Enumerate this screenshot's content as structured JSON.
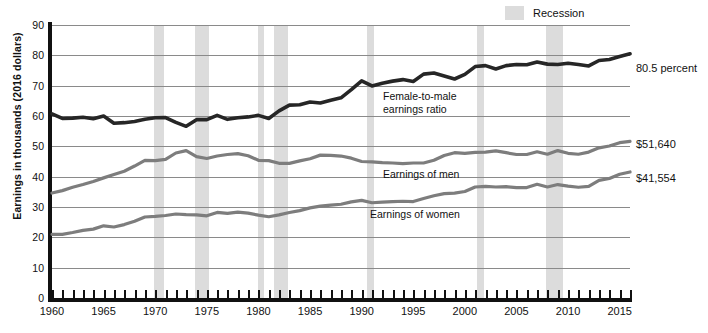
{
  "legend": {
    "position": "top-right",
    "entries": [
      {
        "label": "Recession",
        "color": "#dcdcdc",
        "type": "band"
      }
    ]
  },
  "axes": {
    "ylabel": "Earnings in thousands (2016 dollars)",
    "yticks": [
      "0",
      "10",
      "20",
      "30",
      "40",
      "50",
      "60",
      "70",
      "80",
      "90"
    ],
    "xticks": [
      "1960",
      "1965",
      "1970",
      "1975",
      "1980",
      "1985",
      "1990",
      "1995",
      "2000",
      "2005",
      "2010",
      "2015"
    ]
  },
  "annotations": [
    {
      "name": "ratio-annotation",
      "line1": "Female-to-male",
      "line2": "earnings ratio"
    },
    {
      "name": "men-annotation",
      "line1": "Earnings of men",
      "line2": ""
    },
    {
      "name": "women-annotation",
      "line1": "Earnings of women",
      "line2": ""
    }
  ],
  "end_labels": [
    {
      "name": "ratio-end-label",
      "text": "80.5 percent"
    },
    {
      "name": "men-end-label",
      "text": "$51,640"
    },
    {
      "name": "women-end-label",
      "text": "$41,554"
    }
  ],
  "chart_data": {
    "type": "line",
    "title": "",
    "subtitle": "",
    "xlabel": "",
    "ylabel": "Earnings in thousands (2016 dollars)",
    "xlim": [
      1960,
      2016
    ],
    "ylim": [
      0,
      90
    ],
    "ytick_step": 10,
    "xtick_step_minor": 1,
    "xtick_step_major": 5,
    "grid": "horizontal",
    "legend_position": "top-right",
    "x": [
      1960,
      1961,
      1962,
      1963,
      1964,
      1965,
      1966,
      1967,
      1968,
      1969,
      1970,
      1971,
      1972,
      1973,
      1974,
      1975,
      1976,
      1977,
      1978,
      1979,
      1980,
      1981,
      1982,
      1983,
      1984,
      1985,
      1986,
      1987,
      1988,
      1989,
      1990,
      1991,
      1992,
      1993,
      1994,
      1995,
      1996,
      1997,
      1998,
      1999,
      2000,
      2001,
      2002,
      2003,
      2004,
      2005,
      2006,
      2007,
      2008,
      2009,
      2010,
      2011,
      2012,
      2013,
      2014,
      2015,
      2016
    ],
    "series": [
      {
        "name": "Female-to-male earnings ratio",
        "units": "percent",
        "color": "#262626",
        "end_value": 80.5,
        "end_label": "80.5 percent",
        "values": [
          60.7,
          59.2,
          59.3,
          59.6,
          59.1,
          60.0,
          57.6,
          57.8,
          58.2,
          58.9,
          59.4,
          59.5,
          57.9,
          56.6,
          58.8,
          58.8,
          60.2,
          58.9,
          59.4,
          59.7,
          60.2,
          59.2,
          61.7,
          63.6,
          63.7,
          64.6,
          64.3,
          65.2,
          66.0,
          68.7,
          71.6,
          69.9,
          70.8,
          71.5,
          72.0,
          71.4,
          73.8,
          74.2,
          73.2,
          72.2,
          73.7,
          76.3,
          76.6,
          75.5,
          76.6,
          77.0,
          76.9,
          77.8,
          77.1,
          77.0,
          77.4,
          77.0,
          76.5,
          78.3,
          78.6,
          79.6,
          80.5
        ]
      },
      {
        "name": "Earnings of men",
        "units": "2016 dollars (thousands)",
        "color": "#7d7d7d",
        "end_value": 51.64,
        "end_label": "$51,640",
        "values": [
          34.6,
          35.4,
          36.5,
          37.4,
          38.4,
          39.6,
          40.7,
          41.8,
          43.5,
          45.4,
          45.3,
          45.7,
          47.8,
          48.6,
          46.6,
          46.0,
          46.8,
          47.3,
          47.6,
          46.9,
          45.4,
          45.3,
          44.4,
          44.4,
          45.2,
          45.9,
          47.1,
          47.0,
          46.8,
          46.1,
          45.0,
          44.9,
          44.6,
          44.5,
          44.3,
          44.5,
          44.5,
          45.4,
          47.0,
          47.9,
          47.7,
          48.0,
          48.1,
          48.5,
          47.9,
          47.3,
          47.3,
          48.2,
          47.4,
          48.6,
          47.7,
          47.4,
          48.1,
          49.5,
          50.1,
          51.2,
          51.64
        ]
      },
      {
        "name": "Earnings of women",
        "units": "2016 dollars (thousands)",
        "color": "#7d7d7d",
        "end_value": 41.554,
        "end_label": "$41,554",
        "values": [
          21.0,
          21.0,
          21.6,
          22.3,
          22.7,
          23.8,
          23.4,
          24.2,
          25.3,
          26.7,
          26.9,
          27.2,
          27.7,
          27.5,
          27.4,
          27.1,
          28.2,
          27.9,
          28.3,
          28.0,
          27.3,
          26.8,
          27.4,
          28.2,
          28.8,
          29.7,
          30.3,
          30.6,
          30.9,
          31.7,
          32.2,
          31.4,
          31.6,
          31.8,
          31.9,
          31.8,
          32.8,
          33.7,
          34.4,
          34.6,
          35.1,
          36.6,
          36.8,
          36.6,
          36.7,
          36.4,
          36.4,
          37.5,
          36.6,
          37.4,
          36.9,
          36.5,
          36.8,
          38.8,
          39.4,
          40.8,
          41.554
        ]
      }
    ],
    "recession_bands": [
      {
        "start": 1969.9,
        "end": 1970.9
      },
      {
        "start": 1973.9,
        "end": 1975.2
      },
      {
        "start": 1980.0,
        "end": 1980.5
      },
      {
        "start": 1981.5,
        "end": 1982.9
      },
      {
        "start": 1990.5,
        "end": 1991.2
      },
      {
        "start": 2001.2,
        "end": 2001.9
      },
      {
        "start": 2007.9,
        "end": 2009.5
      }
    ]
  }
}
